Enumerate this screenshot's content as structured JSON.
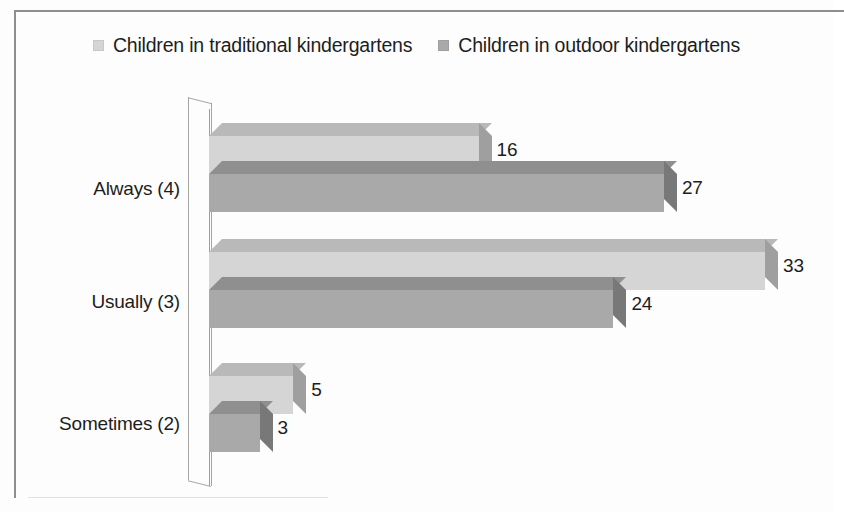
{
  "legend": {
    "items": [
      {
        "label": "Children in traditional kindergartens",
        "color": "#d5d5d5",
        "icon": "legend-swatch-icon"
      },
      {
        "label": "Children in outdoor kindergartens",
        "color": "#a9a9a9",
        "icon": "legend-swatch-icon"
      }
    ]
  },
  "chart_data": {
    "type": "bar",
    "orientation": "horizontal",
    "style": "3d-clustered-bar",
    "title": "",
    "subtitle": "",
    "xlabel": "",
    "ylabel": "",
    "categories": [
      "Always (4)",
      "Usually (3)",
      "Sometimes (2)"
    ],
    "series": [
      {
        "name": "Children in traditional kindergartens",
        "color": "#d5d5d5",
        "values": [
          16,
          33,
          5
        ]
      },
      {
        "name": "Children in outdoor kindergartens",
        "color": "#a9a9a9",
        "values": [
          27,
          24,
          3
        ]
      }
    ],
    "data_labels": [
      "16",
      "27",
      "33",
      "24",
      "5",
      "3"
    ],
    "xlim": [
      0,
      33
    ],
    "grid": false,
    "axis_ticks": [],
    "legend_position": "top"
  },
  "colors": {
    "series_light": "#d5d5d5",
    "series_light_top": "#b9b9b9",
    "series_light_side": "#9f9f9f",
    "series_dark": "#a9a9a9",
    "series_dark_top": "#8f8f8f",
    "series_dark_side": "#787878",
    "axis": "#a5a5a5",
    "text": "#1d1d1d",
    "frame": "#8e8e8e"
  }
}
